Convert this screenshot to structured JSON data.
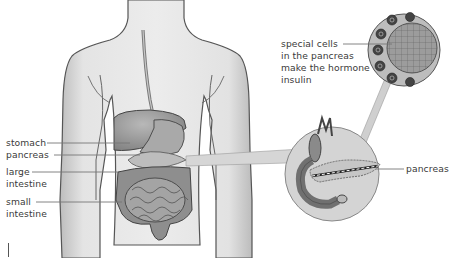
{
  "diagram": {
    "type": "anatomical-illustration",
    "colors": {
      "body_fill": "#e6e6e6",
      "body_outline": "#555555",
      "organ_fill": "#9a9a9a",
      "organ_dark": "#6e6e6e",
      "callout_fill": "#d4d4d4",
      "label_text": "#3a3a3a",
      "leader_line": "#777777"
    },
    "labels": {
      "stomach": "stomach",
      "pancreas_left": "pancreas",
      "large_intestine_line1": "large",
      "large_intestine_line2": "intestine",
      "small_intestine_line1": "small",
      "small_intestine_line2": "intestine",
      "pancreas_right": "pancreas",
      "special_cells_line1": "special cells",
      "special_cells_line2": "in the pancreas",
      "special_cells_line3": "make the hormone",
      "special_cells_line4": "insulin"
    },
    "callouts": [
      {
        "name": "pancreas-magnified",
        "shape": "circle"
      },
      {
        "name": "islet-cells-magnified",
        "shape": "circle"
      }
    ]
  }
}
